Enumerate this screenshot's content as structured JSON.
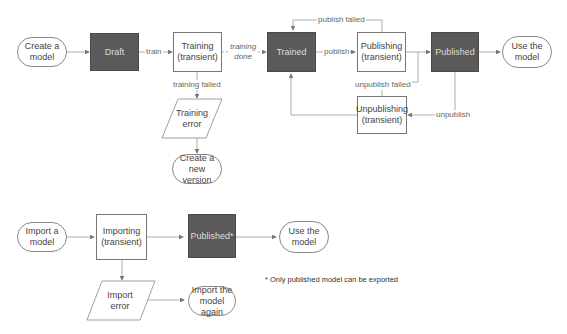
{
  "diagram": {
    "colors": {
      "state_fill": "#5a5a5a",
      "line": "#999999",
      "text": "#444444"
    },
    "nodes": {
      "create_model": "Create a\nmodel",
      "draft": "Draft",
      "training": "Training\n(transient)",
      "trained": "Trained",
      "publishing": "Publishing\n(transient)",
      "published": "Published",
      "use_model_1": "Use the\nmodel",
      "training_error": "Training\nerror",
      "create_new_version": "Create a new\nversion",
      "unpublishing": "Unpublishing\n(transient)",
      "import_model": "Import a\nmodel",
      "importing": "Importing\n(transient)",
      "published_star": "Published*",
      "use_model_2": "Use the\nmodel",
      "import_error": "Import\nerror",
      "import_again": "Import the\nmodel again"
    },
    "edges": {
      "train": "train",
      "training_done": "training\ndone",
      "training_failed": "training failed",
      "publish": "publish",
      "publish_failed": "publish failed",
      "unpublish_failed": "unpublish failed",
      "unpublish": "unpublish"
    },
    "footnote": "* Only published model can be exported"
  }
}
